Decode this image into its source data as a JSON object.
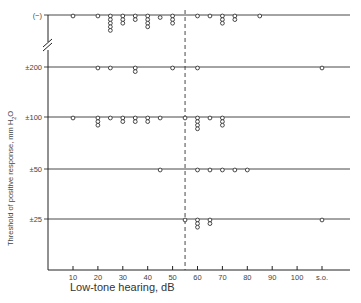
{
  "chart_data": {
    "type": "scatter",
    "title": "",
    "xlabel": "Low-tone hearing, dB",
    "ylabel": "Threshold of positive response, mm H2O",
    "ylabel_parts": {
      "main": "Threshold of positive response, mm H",
      "sub": "2",
      "tail": "O"
    },
    "x_ticks": [
      "10",
      "20",
      "30",
      "40",
      "50",
      "60",
      "70",
      "80",
      "90",
      "100",
      "s.o."
    ],
    "x_tick_values": [
      10,
      20,
      30,
      40,
      50,
      60,
      70,
      80,
      90,
      100,
      110
    ],
    "xlim": [
      0,
      120
    ],
    "y_categories": [
      "(−)",
      "±200",
      "±100",
      "±50",
      "±25"
    ],
    "axis_break": "between (−) and ±200",
    "reference_line": {
      "x": 55,
      "style": "dashed"
    },
    "grid": "horizontal lines at each category",
    "series": [
      {
        "name": "(−)",
        "points": [
          {
            "x": 10,
            "count": 1
          },
          {
            "x": 20,
            "count": 1
          },
          {
            "x": 25,
            "count": 5
          },
          {
            "x": 30,
            "count": 3
          },
          {
            "x": 35,
            "count": 2
          },
          {
            "x": 40,
            "count": 4
          },
          {
            "x": 45,
            "count": 1
          },
          {
            "x": 50,
            "count": 3
          },
          {
            "x": 60,
            "count": 1
          },
          {
            "x": 65,
            "count": 1
          },
          {
            "x": 70,
            "count": 3
          },
          {
            "x": 75,
            "count": 2
          },
          {
            "x": 85,
            "count": 1
          }
        ]
      },
      {
        "name": "±200",
        "points": [
          {
            "x": 20,
            "count": 1
          },
          {
            "x": 25,
            "count": 1
          },
          {
            "x": 35,
            "count": 2
          },
          {
            "x": 50,
            "count": 1
          },
          {
            "x": 60,
            "count": 1
          },
          {
            "x": 110,
            "count": 1
          }
        ]
      },
      {
        "name": "±100",
        "points": [
          {
            "x": 10,
            "count": 1
          },
          {
            "x": 20,
            "count": 3
          },
          {
            "x": 25,
            "count": 1
          },
          {
            "x": 30,
            "count": 2
          },
          {
            "x": 35,
            "count": 2
          },
          {
            "x": 40,
            "count": 2
          },
          {
            "x": 45,
            "count": 1
          },
          {
            "x": 55,
            "count": 1
          },
          {
            "x": 60,
            "count": 4
          },
          {
            "x": 65,
            "count": 1
          },
          {
            "x": 70,
            "count": 3
          }
        ]
      },
      {
        "name": "±50",
        "points": [
          {
            "x": 45,
            "count": 1
          },
          {
            "x": 60,
            "count": 1
          },
          {
            "x": 65,
            "count": 1
          },
          {
            "x": 70,
            "count": 1
          },
          {
            "x": 75,
            "count": 1
          },
          {
            "x": 80,
            "count": 1
          }
        ]
      },
      {
        "name": "±25",
        "points": [
          {
            "x": 55,
            "count": 1
          },
          {
            "x": 60,
            "count": 3
          },
          {
            "x": 65,
            "count": 2
          },
          {
            "x": 110,
            "count": 1
          }
        ]
      }
    ]
  }
}
